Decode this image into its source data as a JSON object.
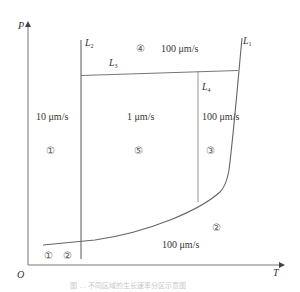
{
  "axes": {
    "y_label": "P",
    "x_label": "T",
    "origin_label": "O"
  },
  "lines": [
    {
      "id": "L1",
      "label": "L",
      "sub": "1"
    },
    {
      "id": "L2",
      "label": "L",
      "sub": "2"
    },
    {
      "id": "L3",
      "label": "L",
      "sub": "3"
    },
    {
      "id": "L4",
      "label": "L",
      "sub": "4"
    }
  ],
  "regions": {
    "r4": {
      "number": "④",
      "rate": "100 μm/s"
    },
    "r1": {
      "number": "①",
      "rate": "10 μm/s"
    },
    "r5": {
      "number": "⑤",
      "rate": "1 μm/s"
    },
    "r3": {
      "number": "③",
      "rate": "100 μm/s"
    },
    "r2": {
      "number": "②",
      "rate": "100 μm/s"
    },
    "bottom_left": {
      "n1": "①",
      "n2": "②"
    }
  },
  "caption": "图 … 不同区域的生长速率分区示意图",
  "colors": {
    "line": "#6e6e6e",
    "text": "#333333"
  }
}
